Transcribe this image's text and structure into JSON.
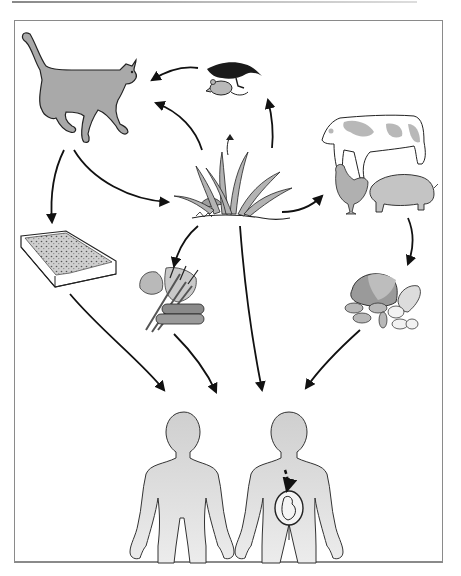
{
  "diagram": {
    "type": "transmission-cycle",
    "text_labels": [],
    "colors": {
      "animal_fill": "#a9a9a9",
      "human_fill": "#d8d8d8",
      "outline": "#222222",
      "arrow": "#111111",
      "frame_border": "#8a8a8a",
      "background": "#ffffff"
    },
    "nodes": [
      {
        "id": "cat",
        "icon": "cat-icon"
      },
      {
        "id": "bird-and-mouse",
        "icon": "bird-mouse-icon"
      },
      {
        "id": "grass-soil",
        "icon": "grass-icon"
      },
      {
        "id": "livestock",
        "icon": "livestock-icon",
        "contains": [
          "cow",
          "chicken",
          "pig"
        ]
      },
      {
        "id": "litter-box",
        "icon": "litter-box-icon"
      },
      {
        "id": "vegetables",
        "icon": "vegetables-icon"
      },
      {
        "id": "meat",
        "icon": "meat-icon"
      },
      {
        "id": "human-adult",
        "icon": "human-icon"
      },
      {
        "id": "pregnant-woman",
        "icon": "pregnant-woman-icon",
        "contains": [
          "fetus"
        ]
      }
    ],
    "edges": [
      {
        "from": "bird-and-mouse",
        "to": "cat",
        "style": "solid"
      },
      {
        "from": "grass-soil",
        "to": "cat",
        "style": "solid"
      },
      {
        "from": "grass-soil",
        "to": "bird-and-mouse",
        "style": "solid"
      },
      {
        "from": "cat",
        "to": "grass-soil",
        "style": "solid"
      },
      {
        "from": "cat",
        "to": "litter-box",
        "style": "solid"
      },
      {
        "from": "grass-soil",
        "to": "livestock",
        "style": "solid"
      },
      {
        "from": "grass-soil",
        "to": "vegetables",
        "style": "solid"
      },
      {
        "from": "grass-soil",
        "to": "humans",
        "style": "solid"
      },
      {
        "from": "livestock",
        "to": "meat",
        "style": "solid"
      },
      {
        "from": "litter-box",
        "to": "humans",
        "style": "solid"
      },
      {
        "from": "vegetables",
        "to": "humans",
        "style": "solid"
      },
      {
        "from": "meat",
        "to": "humans",
        "style": "solid"
      },
      {
        "from": "pregnant-woman",
        "to": "fetus",
        "style": "dashed"
      }
    ]
  }
}
